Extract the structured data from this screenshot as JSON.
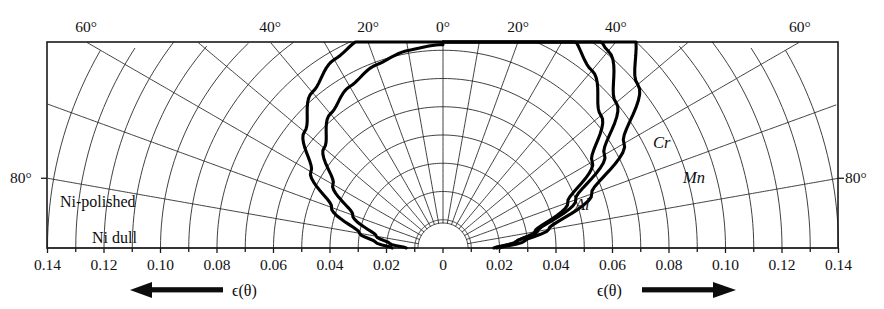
{
  "figure": {
    "kind": "polar-emissivity-diagram",
    "background_color": "#ffffff",
    "ink_color": "#111111",
    "frame": {
      "x": 47,
      "y": 42,
      "width": 791,
      "height": 206
    },
    "origin": {
      "x": 443,
      "y": 248
    },
    "inner_cutout_radius": 25
  },
  "axes": {
    "left": {
      "direction_label": "ϵ(θ)",
      "arrow": "left",
      "tick_labels": [
        "0.14",
        "0.12",
        "0.10",
        "0.08",
        "0.06",
        "0.04",
        "0.02",
        "0"
      ],
      "tick_values": [
        0.14,
        0.12,
        0.1,
        0.08,
        0.06,
        0.04,
        0.02,
        0
      ]
    },
    "right": {
      "direction_label": "ϵ(θ)",
      "arrow": "right",
      "tick_labels": [
        "0",
        "0.02",
        "0.04",
        "0.06",
        "0.08",
        "0.10",
        "0.12",
        "0.14"
      ],
      "tick_values": [
        0,
        0.02,
        0.04,
        0.06,
        0.08,
        0.1,
        0.12,
        0.14
      ]
    },
    "angle_labels_top_left": [
      "60°",
      "40°",
      "20°",
      "0°"
    ],
    "angle_labels_top_right": [
      "20°",
      "40°",
      "60°"
    ],
    "angle_label_side_left": "80°",
    "angle_label_side_right": "80°",
    "minor_tick_step": 0.01,
    "major_tick_step": 0.02,
    "epsilon_max": 0.14
  },
  "chart_data": {
    "type": "line",
    "title": "",
    "xlabel": "ϵ(θ)",
    "ylabel": "",
    "coordinate_system": "polar",
    "angle_unit": "degrees",
    "angle_range": [
      0,
      90
    ],
    "radial_range": [
      0,
      0.14
    ],
    "grid": true,
    "legend": "inline-labels",
    "series": [
      {
        "name": "Ni-polished",
        "side": "left",
        "label_position": "above-curve-left",
        "angles": [
          0,
          10,
          20,
          30,
          40,
          50,
          60,
          70,
          80,
          85,
          90
        ],
        "emissivity": [
          0.072,
          0.071,
          0.069,
          0.066,
          0.062,
          0.055,
          0.045,
          0.034,
          0.024,
          0.019,
          0.013
        ]
      },
      {
        "name": "Ni dull",
        "side": "left",
        "label_position": "below-curve-left",
        "angles": [
          0,
          10,
          20,
          30,
          40,
          50,
          60,
          70,
          80,
          85,
          90
        ],
        "emissivity": [
          0.083,
          0.082,
          0.08,
          0.077,
          0.072,
          0.064,
          0.054,
          0.042,
          0.03,
          0.024,
          0.018
        ]
      },
      {
        "name": "Cr",
        "side": "right",
        "label_position": "below-curve-right",
        "angles": [
          0,
          10,
          20,
          30,
          40,
          50,
          60,
          70,
          80,
          85,
          90
        ],
        "emissivity": [
          0.122,
          0.121,
          0.118,
          0.112,
          0.103,
          0.09,
          0.074,
          0.056,
          0.038,
          0.029,
          0.02
        ]
      },
      {
        "name": "Mn",
        "side": "right",
        "label_position": "below-curve-right",
        "angles": [
          0,
          10,
          20,
          30,
          40,
          50,
          60,
          70,
          80,
          85,
          90
        ],
        "emissivity": [
          0.108,
          0.107,
          0.104,
          0.099,
          0.091,
          0.08,
          0.066,
          0.05,
          0.034,
          0.026,
          0.018
        ]
      },
      {
        "name": "Al",
        "side": "right",
        "label_position": "below-curve-right",
        "angles": [
          0,
          10,
          20,
          30,
          40,
          50,
          60,
          70,
          80,
          85,
          90
        ],
        "emissivity": [
          0.095,
          0.094,
          0.092,
          0.088,
          0.082,
          0.073,
          0.061,
          0.047,
          0.033,
          0.026,
          0.019
        ]
      }
    ]
  },
  "labels": {
    "ni_polished": "Ni-polished",
    "ni_dull": "Ni dull",
    "cr": "Cr",
    "mn": "Mn",
    "al": "Al",
    "eps_left": "ϵ(θ)",
    "eps_right": "ϵ(θ)",
    "deg80_left": "80°",
    "deg80_right": "80°"
  }
}
